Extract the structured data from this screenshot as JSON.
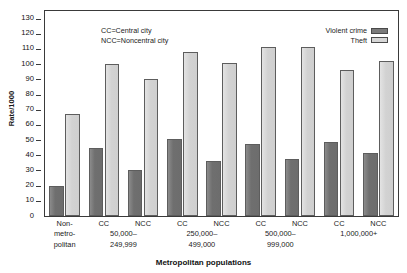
{
  "chart_data": {
    "type": "bar",
    "title": "",
    "subtitle": "",
    "xlabel": "Metropolitan populations",
    "ylabel": "Rate/1000",
    "ylim": [
      0,
      135
    ],
    "yticks": [
      0,
      10,
      20,
      30,
      40,
      50,
      60,
      70,
      80,
      90,
      100,
      110,
      120,
      130
    ],
    "grid": false,
    "legend_position": "top-right",
    "annotations": [
      "CC=Central city",
      "NCC=Noncentral city"
    ],
    "categories": [
      "Non-metropolitan",
      "CC 50,000–249,999",
      "NCC 50,000–249,999",
      "CC 250,000–499,000",
      "NCC 250,000–499,000",
      "CC 500,000–999,000",
      "NCC 500,000–999,000",
      "CC 1,000,000+",
      "NCC 1,000,000+"
    ],
    "series": [
      {
        "name": "Violent crime",
        "color": "#7a7a7a",
        "values": [
          19.5,
          45,
          30,
          50.5,
          36,
          47.5,
          37.5,
          49,
          41.5
        ]
      },
      {
        "name": "Theft",
        "color": "#d6d6d6",
        "values": [
          67.5,
          100,
          90.5,
          108,
          100.5,
          111.5,
          111.5,
          96,
          102
        ]
      }
    ]
  },
  "legend": {
    "items": [
      {
        "label": "Violent crime",
        "color": "#7a7a7a"
      },
      {
        "label": "Theft",
        "color": "#d6d6d6"
      }
    ]
  },
  "annotation": {
    "line1": "CC=Central city",
    "line2": "NCC=Noncentral city"
  },
  "axes": {
    "y_label": "Rate/1000",
    "x_label": "Metropolitan populations",
    "y_ticks": [
      "130",
      "120",
      "110",
      "100",
      "90",
      "80",
      "70",
      "60",
      "50",
      "40",
      "30",
      "20",
      "10",
      "0"
    ]
  },
  "x_groups": [
    {
      "cats": [
        "Non-"
      ],
      "range_lines": [
        "metro-",
        "politan"
      ],
      "single": true
    },
    {
      "cats": [
        "CC",
        "NCC"
      ],
      "range_lines": [
        "50,000–",
        "249,999"
      ],
      "single": false
    },
    {
      "cats": [
        "CC",
        "NCC"
      ],
      "range_lines": [
        "250,000–",
        "499,000"
      ],
      "single": false
    },
    {
      "cats": [
        "CC",
        "NCC"
      ],
      "range_lines": [
        "500,000–",
        "999,000"
      ],
      "single": false
    },
    {
      "cats": [
        "CC",
        "NCC"
      ],
      "range_lines": [
        "1,000,000+",
        ""
      ],
      "single": false
    }
  ]
}
